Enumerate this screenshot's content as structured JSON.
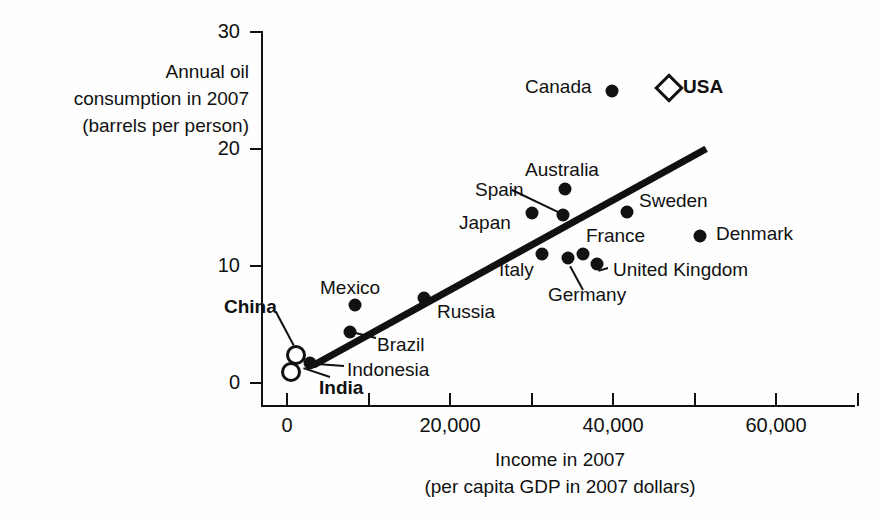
{
  "chart_data": {
    "type": "scatter",
    "title": "",
    "xlabel": "Income in 2007 (per capita GDP in 2007 dollars)",
    "ylabel": "Annual oil consumption in 2007 (barrels per person)",
    "xlim": [
      0,
      70000
    ],
    "ylim": [
      0,
      30
    ],
    "grid": false,
    "legend": "none",
    "xticks": [
      "0",
      "20,000",
      "40,000",
      "60,000"
    ],
    "xtick_values": [
      0,
      20000,
      40000,
      60000
    ],
    "yticks": [
      "0",
      "10",
      "20",
      "30"
    ],
    "ytick_values": [
      0,
      10,
      20,
      30
    ],
    "points": [
      {
        "label": "China",
        "x": 1100,
        "y": 2.4,
        "marker": "open-circle",
        "bold": true
      },
      {
        "label": "India",
        "x": 500,
        "y": 0.9,
        "marker": "open-circle",
        "bold": true
      },
      {
        "label": "Indonesia",
        "x": 2800,
        "y": 1.7,
        "marker": "filled-circle",
        "bold": false
      },
      {
        "label": "Brazil",
        "x": 7700,
        "y": 4.4,
        "marker": "filled-circle",
        "bold": false
      },
      {
        "label": "Mexico",
        "x": 8300,
        "y": 6.7,
        "marker": "filled-circle",
        "bold": false
      },
      {
        "label": "Russia",
        "x": 16800,
        "y": 7.3,
        "marker": "filled-circle",
        "bold": false
      },
      {
        "label": "Japan",
        "x": 30000,
        "y": 14.5,
        "marker": "filled-circle",
        "bold": false
      },
      {
        "label": "Italy",
        "x": 31300,
        "y": 11.0,
        "marker": "filled-circle",
        "bold": false
      },
      {
        "label": "Spain",
        "x": 33900,
        "y": 14.4,
        "marker": "filled-circle",
        "bold": false
      },
      {
        "label": "Australia",
        "x": 34100,
        "y": 16.6,
        "marker": "filled-circle",
        "bold": false
      },
      {
        "label": "Germany",
        "x": 34500,
        "y": 10.7,
        "marker": "filled-circle",
        "bold": false
      },
      {
        "label": "France",
        "x": 36300,
        "y": 11.0,
        "marker": "filled-circle",
        "bold": false
      },
      {
        "label": "United Kingdom",
        "x": 38000,
        "y": 10.2,
        "marker": "filled-circle",
        "bold": false
      },
      {
        "label": "Canada",
        "x": 39900,
        "y": 25.0,
        "marker": "filled-circle",
        "bold": false
      },
      {
        "label": "Sweden",
        "x": 41700,
        "y": 14.6,
        "marker": "filled-circle",
        "bold": false
      },
      {
        "label": "USA",
        "x": 46900,
        "y": 25.2,
        "marker": "open-diamond",
        "bold": true
      },
      {
        "label": "Denmark",
        "x": 50700,
        "y": 12.6,
        "marker": "filled-circle",
        "bold": false
      }
    ],
    "trend_line": {
      "x0": 3200,
      "y0": 1.5,
      "x1": 51400,
      "y1": 20.0
    }
  },
  "axes": {
    "y_title_line1": "Annual oil",
    "y_title_line2": "consumption in 2007",
    "y_title_line3": "(barrels per person)",
    "x_title_line1": "Income in 2007",
    "x_title_line2": "(per capita GDP in 2007 dollars)"
  },
  "labels": {
    "china": "China",
    "india": "India",
    "indonesia": "Indonesia",
    "brazil": "Brazil",
    "mexico": "Mexico",
    "russia": "Russia",
    "japan": "Japan",
    "italy": "Italy",
    "spain": "Spain",
    "australia": "Australia",
    "germany": "Germany",
    "france": "France",
    "united_kingdom": "United Kingdom",
    "canada": "Canada",
    "sweden": "Sweden",
    "usa": "USA",
    "denmark": "Denmark"
  },
  "colors": {
    "ink": "#111111",
    "background": "#ffffff"
  }
}
